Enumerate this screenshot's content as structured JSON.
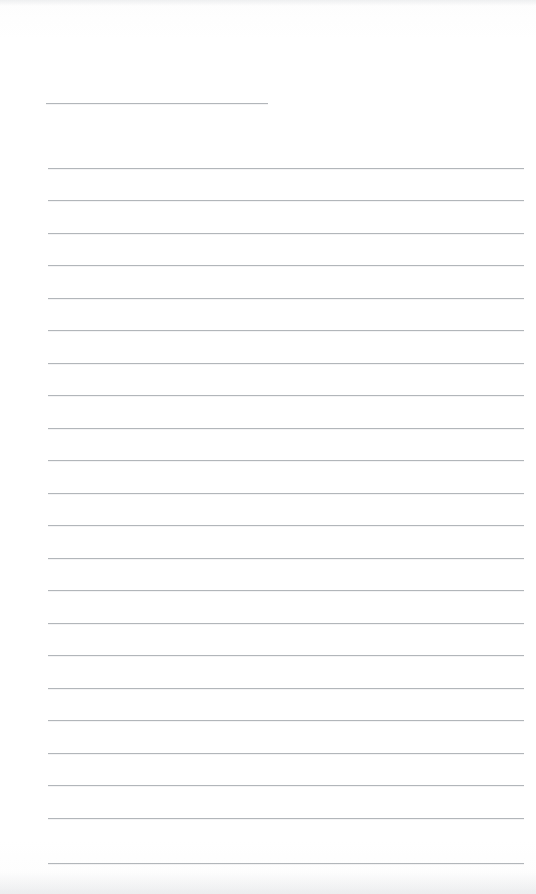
{
  "page": {
    "kind": "lined-notepad-page",
    "width": 536,
    "height": 894,
    "background_color": "#fefefe",
    "line_color": "#b2b6ba",
    "content_text": "",
    "note": "blank ruled page, no written text"
  },
  "header_rule": {
    "label": "header-underline",
    "x_start": 46,
    "x_end": 268,
    "y": 103,
    "thickness": 1
  },
  "ruled_lines": {
    "label": "body-ruled-lines",
    "count": 22,
    "x_start": 48,
    "x_end": 524,
    "y_first": 168,
    "spacing": 32.4,
    "thickness": 1,
    "y_positions": [
      168,
      200,
      233,
      265,
      298,
      330,
      363,
      395,
      428,
      460,
      493,
      525,
      558,
      590,
      623,
      655,
      688,
      720,
      753,
      785,
      818,
      863
    ]
  },
  "scan_artifacts": {
    "top_smudge_label": "top-scan-smudge",
    "bottom_smudge_label": "bottom-scan-smudge"
  }
}
